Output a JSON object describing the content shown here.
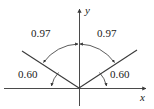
{
  "figure": {
    "type": "geometry-angle-diagram",
    "width": 154,
    "height": 109,
    "background_color": "#ffffff",
    "stroke_color": "#3a3a3a",
    "text_color": "#1a1a1a"
  },
  "axes": {
    "x_label": "x",
    "y_label": "y",
    "origin": {
      "x": 79,
      "y": 88
    },
    "x_axis": {
      "x1": 4,
      "y1": 88,
      "x2": 148,
      "y2": 88,
      "arrow": "right"
    },
    "y_axis": {
      "x1": 79,
      "y1": 105,
      "x2": 79,
      "y2": 7,
      "arrow": "up"
    }
  },
  "rays": [
    {
      "name": "left-ray",
      "from_x": 79,
      "from_y": 88,
      "to_x": 22,
      "to_y": 51
    },
    {
      "name": "right-ray",
      "from_x": 79,
      "from_y": 88,
      "to_x": 137,
      "to_y": 50
    }
  ],
  "arcs": {
    "upper_arc": {
      "name": "upper-angle-arc",
      "description": "large arc spanning between the two rays with double arrowheads",
      "radius": 44
    },
    "lower_left_arc": {
      "name": "lower-left-angle-arc",
      "description": "small arc between left ray and negative x-axis",
      "radius": 28
    },
    "lower_right_arc": {
      "name": "lower-right-angle-arc",
      "description": "small arc between right ray and positive x-axis",
      "radius": 28
    }
  },
  "labels": {
    "upper_left": {
      "text": "0.97",
      "x": 31,
      "y": 28
    },
    "upper_right": {
      "text": "0.97",
      "x": 97,
      "y": 28
    },
    "lower_left": {
      "text": "0.60",
      "x": 18,
      "y": 69
    },
    "lower_right": {
      "text": "0.60",
      "x": 110,
      "y": 69
    },
    "y_axis_label": {
      "text": "y",
      "x": 85,
      "y": 5
    },
    "x_axis_label": {
      "text": "x",
      "x": 140,
      "y": 92
    }
  }
}
